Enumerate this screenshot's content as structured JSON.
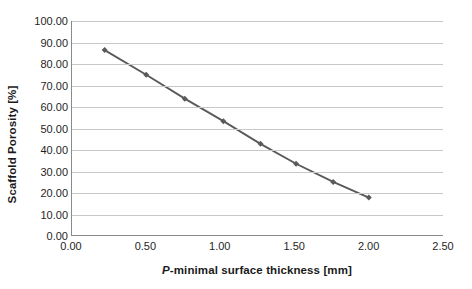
{
  "chart_data": {
    "type": "line",
    "title": "",
    "xlabel_prefix": "P",
    "xlabel_rest": "-minimal surface thickness [mm]",
    "xlabel": "P-minimal surface thickness [mm]",
    "ylabel": "Scaffold Porosity [%]",
    "xlim": [
      0.0,
      2.5
    ],
    "ylim": [
      0.0,
      100.0
    ],
    "grid": true,
    "legend": "none",
    "series_color": "#5a5a5a",
    "marker": "diamond",
    "xticks": [
      "0.00",
      "0.50",
      "1.00",
      "1.50",
      "2.00",
      "2.50"
    ],
    "xtick_values": [
      0.0,
      0.5,
      1.0,
      1.5,
      2.0,
      2.5
    ],
    "yticks": [
      "0.00",
      "10.00",
      "20.00",
      "30.00",
      "40.00",
      "50.00",
      "60.00",
      "70.00",
      "80.00",
      "90.00",
      "100.00"
    ],
    "ytick_values": [
      0,
      10,
      20,
      30,
      40,
      50,
      60,
      70,
      80,
      90,
      100
    ],
    "series": [
      {
        "name": "Scaffold Porosity",
        "x": [
          0.22,
          0.5,
          0.76,
          1.02,
          1.27,
          1.51,
          1.76,
          2.0
        ],
        "values": [
          86.4,
          74.9,
          63.7,
          53.2,
          42.6,
          33.3,
          24.8,
          17.5
        ]
      }
    ]
  }
}
